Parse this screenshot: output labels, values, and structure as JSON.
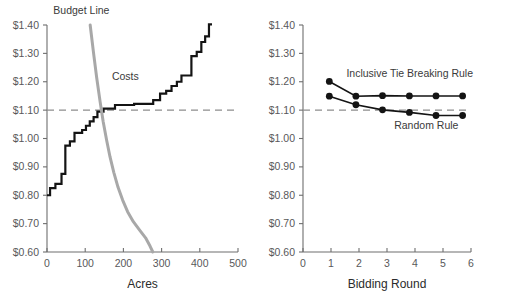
{
  "figure": {
    "background_color": "#ffffff",
    "panel_count": 2
  },
  "chart_data": [
    {
      "type": "line",
      "id": "left-panel",
      "title": "",
      "subtitle": "",
      "xlabel": "Acres",
      "ylabel": "",
      "xlim": [
        0,
        500
      ],
      "ylim": [
        0.6,
        1.4
      ],
      "grid": false,
      "legend_position": "inline-annotations",
      "x_ticks": [
        0,
        100,
        200,
        300,
        400,
        500
      ],
      "x_tick_labels": [
        "0",
        "100",
        "200",
        "300",
        "400",
        "500"
      ],
      "y_ticks": [
        0.6,
        0.7,
        0.8,
        0.9,
        1.0,
        1.1,
        1.2,
        1.3,
        1.4
      ],
      "y_tick_labels": [
        "$0.60",
        "$0.70",
        "$0.80",
        "$0.90",
        "$1.00",
        "$1.10",
        "$1.20",
        "$1.30",
        "$1.40"
      ],
      "annotations": [
        {
          "text": "Budget Line",
          "x": 90,
          "y": 1.44,
          "color": "#3a3a3a"
        },
        {
          "text": "Costs",
          "x": 205,
          "y": 1.205,
          "color": "#3a3a3a"
        }
      ],
      "reference_lines": [
        {
          "orientation": "horizontal",
          "value": 1.1,
          "style": "dashed",
          "color": "#8d8d8d"
        }
      ],
      "series": [
        {
          "name": "Costs",
          "style": "step",
          "color": "#141414",
          "points": [
            [
              0,
              0.8
            ],
            [
              8,
              0.8
            ],
            [
              8,
              0.825
            ],
            [
              22,
              0.825
            ],
            [
              22,
              0.84
            ],
            [
              38,
              0.84
            ],
            [
              38,
              0.875
            ],
            [
              48,
              0.875
            ],
            [
              48,
              0.975
            ],
            [
              60,
              0.975
            ],
            [
              60,
              0.99
            ],
            [
              72,
              0.99
            ],
            [
              72,
              1.02
            ],
            [
              92,
              1.02
            ],
            [
              92,
              1.03
            ],
            [
              102,
              1.03
            ],
            [
              102,
              1.045
            ],
            [
              112,
              1.045
            ],
            [
              112,
              1.06
            ],
            [
              122,
              1.06
            ],
            [
              122,
              1.075
            ],
            [
              132,
              1.075
            ],
            [
              132,
              1.095
            ],
            [
              148,
              1.095
            ],
            [
              148,
              1.105
            ],
            [
              178,
              1.105
            ],
            [
              178,
              1.118
            ],
            [
              228,
              1.118
            ],
            [
              228,
              1.122
            ],
            [
              278,
              1.122
            ],
            [
              278,
              1.135
            ],
            [
              296,
              1.135
            ],
            [
              296,
              1.158
            ],
            [
              312,
              1.158
            ],
            [
              312,
              1.168
            ],
            [
              326,
              1.168
            ],
            [
              326,
              1.185
            ],
            [
              340,
              1.185
            ],
            [
              340,
              1.2
            ],
            [
              352,
              1.2
            ],
            [
              352,
              1.222
            ],
            [
              378,
              1.222
            ],
            [
              378,
              1.29
            ],
            [
              392,
              1.29
            ],
            [
              392,
              1.305
            ],
            [
              404,
              1.305
            ],
            [
              404,
              1.34
            ],
            [
              414,
              1.34
            ],
            [
              414,
              1.36
            ],
            [
              424,
              1.36
            ],
            [
              424,
              1.402
            ],
            [
              432,
              1.402
            ]
          ]
        },
        {
          "name": "Budget Line",
          "style": "smooth",
          "color": "#a8a8a8",
          "points": [
            [
              113,
              1.4
            ],
            [
              122,
              1.3
            ],
            [
              130,
              1.215
            ],
            [
              139,
              1.13
            ],
            [
              147,
              1.06
            ],
            [
              156,
              0.995
            ],
            [
              165,
              0.935
            ],
            [
              175,
              0.88
            ],
            [
              186,
              0.828
            ],
            [
              198,
              0.783
            ],
            [
              211,
              0.742
            ],
            [
              226,
              0.707
            ],
            [
              242,
              0.678
            ],
            [
              258,
              0.65
            ],
            [
              270,
              0.62
            ],
            [
              277,
              0.6
            ]
          ]
        }
      ]
    },
    {
      "type": "line",
      "id": "right-panel",
      "title": "",
      "subtitle": "",
      "xlabel": "Bidding Round",
      "ylabel": "",
      "xlim": [
        0,
        6
      ],
      "ylim": [
        0.6,
        1.4
      ],
      "grid": false,
      "legend_position": "inline-annotations",
      "x_ticks": [
        0,
        1,
        2,
        3,
        4,
        5,
        6
      ],
      "x_tick_labels": [
        "0",
        "1",
        "2",
        "3",
        "4",
        "5",
        "6"
      ],
      "y_ticks": [
        0.6,
        0.7,
        0.8,
        0.9,
        1.0,
        1.1,
        1.2,
        1.3,
        1.4
      ],
      "y_tick_labels": [
        "$0.60",
        "$0.70",
        "$0.80",
        "$0.90",
        "$1.00",
        "$1.10",
        "$1.20",
        "$1.30",
        "$1.40"
      ],
      "annotations": [
        {
          "text": "Inclusive Tie Breaking Rule",
          "x": 1.55,
          "y": 1.215,
          "color": "#3a3a3a"
        },
        {
          "text": "Random Rule",
          "x": 5.55,
          "y": 1.035,
          "color": "#3a3a3a"
        }
      ],
      "reference_lines": [
        {
          "orientation": "horizontal",
          "value": 1.1,
          "style": "dashed",
          "color": "#8d8d8d"
        }
      ],
      "x": [
        0.94,
        1.89,
        2.84,
        3.8,
        4.75,
        5.7
      ],
      "series": [
        {
          "name": "Inclusive Tie Breaking Rule",
          "color": "#141414",
          "marker": "circle",
          "values": [
            1.201,
            1.149,
            1.151,
            1.15,
            1.15,
            1.15
          ]
        },
        {
          "name": "Random Rule",
          "color": "#141414",
          "marker": "circle",
          "values": [
            1.149,
            1.119,
            1.101,
            1.092,
            1.081,
            1.081
          ]
        }
      ]
    }
  ]
}
